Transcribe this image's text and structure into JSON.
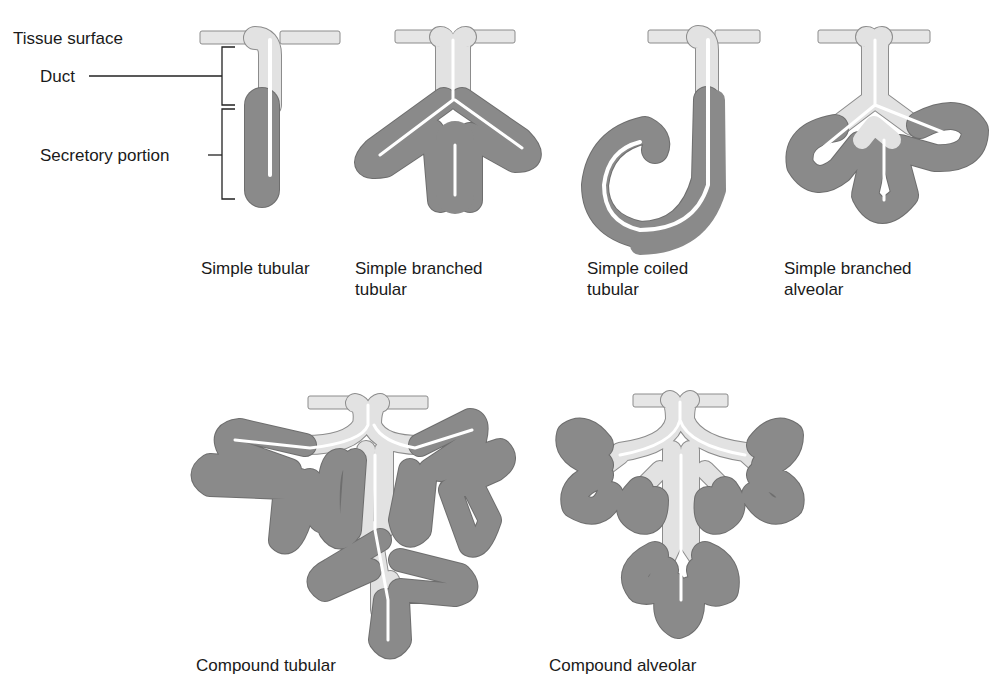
{
  "figure": {
    "annotations": {
      "tissue_surface": "Tissue surface",
      "duct": "Duct",
      "secretory_portion": "Secretory portion"
    },
    "glands": [
      {
        "id": "simple-tubular",
        "caption": "Simple tubular"
      },
      {
        "id": "simple-branched-tubular",
        "caption": "Simple branched\ntubular"
      },
      {
        "id": "simple-coiled-tubular",
        "caption": "Simple coiled\ntubular"
      },
      {
        "id": "simple-branched-alveolar",
        "caption": "Simple branched\nalveolar"
      },
      {
        "id": "compound-tubular",
        "caption": "Compound tubular"
      },
      {
        "id": "compound-alveolar",
        "caption": "Compound alveolar"
      }
    ],
    "colors": {
      "secretory": "#8a8a8a",
      "duct": "#e2e2e2",
      "outline": "#6e6e6e",
      "text": "#1a1a1a"
    }
  }
}
